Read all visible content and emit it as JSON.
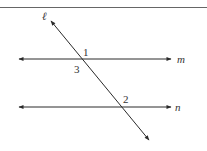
{
  "diagram": {
    "lines": {
      "transversal": "ℓ",
      "upper": "m",
      "lower": "n"
    },
    "angles": {
      "a1": "1",
      "a2": "2",
      "a3": "3"
    },
    "colors": {
      "line": "#2a2a2a",
      "border": "#555555"
    }
  }
}
